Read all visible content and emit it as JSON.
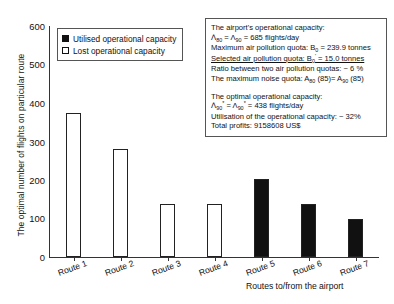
{
  "chart_data": {
    "type": "bar",
    "title": "",
    "xlabel": "Routes to/from the airport",
    "ylabel": "The optimal number of flights on particular route",
    "categories": [
      "Route 1",
      "Route 2",
      "Route 3",
      "Route 4",
      "Route 5",
      "Route 6",
      "Route 7"
    ],
    "values": [
      375,
      280,
      138,
      138,
      202,
      137,
      98
    ],
    "bar_kinds": [
      "lost",
      "lost",
      "lost",
      "lost",
      "utilised",
      "utilised",
      "utilised"
    ],
    "ylim": [
      0,
      600
    ],
    "yticks": [
      0,
      100,
      200,
      300,
      400,
      500,
      600
    ],
    "grid": false,
    "legend_position": "top-left-inside",
    "series": [
      {
        "name": "Utilised operational capacity",
        "key": "utilised",
        "color": "#111111"
      },
      {
        "name": "Lost operational capacity",
        "key": "lost",
        "color": "#ffffff"
      }
    ]
  },
  "legend": {
    "items": [
      {
        "label": "Utilised operational capacity",
        "style": "filled"
      },
      {
        "label": "Lost operational capacity",
        "style": "open"
      }
    ]
  },
  "annotation": {
    "block1_heading": "The airport's operational capacity:",
    "block1_line2_prefix": "Λ",
    "block1_line2_sub1": "80",
    "block1_line2_mid": " = Λ",
    "block1_line2_sub2": "90",
    "block1_line2_suffix": " = 685 flights/day",
    "block1_line3_prefix": "Maximum air pollution quota: B",
    "block1_line3_sub": "0",
    "block1_line3_suffix": " = 239.9 tonnes",
    "block1_line4_prefix": "Selected air pollution quota: B",
    "block1_line4_sub": "0",
    "block1_line4_prime": "'",
    "block1_line4_suffix": " = 15.0 tonnes",
    "block1_line5": "Ratio between two air pollution quotas: ~ 6 %",
    "block1_line6_prefix": "The maximum noise quota: A",
    "block1_line6_sub1": "80",
    "block1_line6_mid": " (85)= A",
    "block1_line6_sub2": "90",
    "block1_line6_suffix": " (85)",
    "block2_heading": "The optimal operational capacity:",
    "block2_line2_prefix": "Λ",
    "block2_line2_sub1": "80",
    "block2_line2_prime1": "*",
    "block2_line2_mid": " = Λ",
    "block2_line2_sub2": "90",
    "block2_line2_prime2": "*",
    "block2_line2_suffix": " = 438 flights/day",
    "block2_line3": "Utilisation of the operational capacity: ~ 32%",
    "block2_line4": "Total profits: 9158608 US$"
  }
}
